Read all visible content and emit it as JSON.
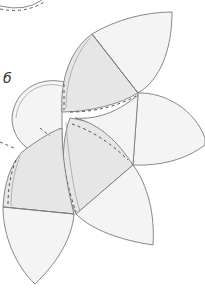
{
  "figure": {
    "label": "б",
    "colors": {
      "line": "#7a7a7a",
      "shade": "#e6e6e6",
      "light": "#f4f4f4",
      "seam": "#555555",
      "background": "#ffffff"
    },
    "parts": [
      {
        "name": "top-petal",
        "shaded_half": true
      },
      {
        "name": "right-petal",
        "shaded_half": false
      },
      {
        "name": "left-circle",
        "shaded_half": false
      },
      {
        "name": "center-petal",
        "shaded_half": true
      },
      {
        "name": "bottom-right-petal",
        "shaded_half": false
      },
      {
        "name": "bottom-left-petal",
        "shaded_half": true
      }
    ]
  }
}
